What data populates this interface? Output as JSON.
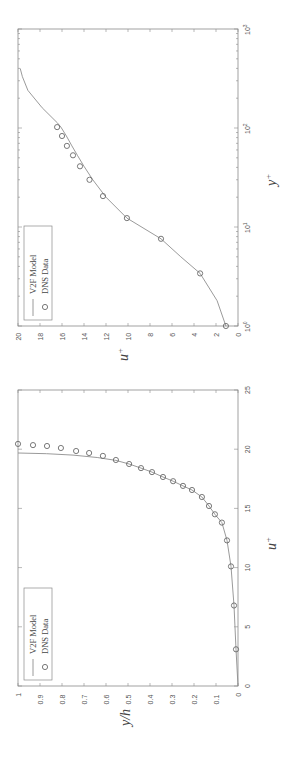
{
  "chart_data": [
    {
      "type": "line",
      "title": "",
      "xlabel": "y+",
      "ylabel": "u+",
      "xscale": "log",
      "xlim": [
        1,
        1000
      ],
      "ylim": [
        0,
        20
      ],
      "xticks": [
        "10^0",
        "10^1",
        "10^2",
        "10^3"
      ],
      "yticks": [
        "0",
        "2",
        "4",
        "6",
        "8",
        "10",
        "12",
        "14",
        "16",
        "18",
        "20"
      ],
      "grid": false,
      "legend_position": "upper left",
      "orientation": "rotated 90° (x-axis vertical on right side, y-axis horizontal at bottom)",
      "series": [
        {
          "name": "V2F Model",
          "style": "line",
          "x": [
            1,
            1.8,
            3.4,
            5.0,
            7.6,
            12.3,
            20,
            30,
            41,
            53,
            66,
            83,
            102,
            112,
            160,
            240,
            330,
            400
          ],
          "y": [
            1.1,
            1.9,
            3.45,
            5.2,
            7.0,
            10.1,
            12.0,
            13.2,
            14.0,
            14.6,
            15.1,
            15.6,
            16.1,
            16.4,
            17.8,
            19.1,
            19.6,
            19.8
          ]
        },
        {
          "name": "DNS Data",
          "style": "circle-markers",
          "x": [
            1.0,
            3.4,
            7.6,
            12.3,
            20.5,
            30,
            41,
            53,
            66,
            83,
            102
          ],
          "y": [
            1.1,
            3.45,
            7.0,
            10.1,
            12.27,
            13.5,
            14.36,
            15.0,
            15.55,
            16.0,
            16.45
          ]
        }
      ]
    },
    {
      "type": "line",
      "title": "",
      "xlabel": "u+",
      "ylabel": "y/h",
      "xlim": [
        0,
        25
      ],
      "ylim": [
        0,
        1
      ],
      "xticks": [
        "0",
        "5",
        "10",
        "15",
        "20",
        "25"
      ],
      "yticks": [
        "0",
        "0.1",
        "0.2",
        "0.3",
        "0.4",
        "0.5",
        "0.6",
        "0.7",
        "0.8",
        "0.9",
        "1"
      ],
      "grid": false,
      "legend_position": "upper left",
      "orientation": "rotated 90° (x-axis vertical on right side, y-axis horizontal at bottom)",
      "series": [
        {
          "name": "V2F Model",
          "style": "line",
          "x": [
            0,
            3.1,
            6.8,
            10.1,
            12.3,
            13.8,
            14.5,
            15.2,
            15.96,
            16.55,
            16.9,
            17.3,
            17.65,
            18.07,
            18.4,
            18.75,
            19.05,
            19.3,
            19.5,
            19.62,
            19.68
          ],
          "y": [
            0,
            0.009,
            0.018,
            0.032,
            0.05,
            0.073,
            0.105,
            0.132,
            0.164,
            0.209,
            0.25,
            0.295,
            0.341,
            0.391,
            0.441,
            0.495,
            0.555,
            0.64,
            0.75,
            0.87,
            1.0
          ]
        },
        {
          "name": "DNS Data",
          "style": "circle-markers",
          "x": [
            3.1,
            6.8,
            10.1,
            12.3,
            13.8,
            14.5,
            15.2,
            15.96,
            16.55,
            16.9,
            17.3,
            17.65,
            18.07,
            18.4,
            18.75,
            19.09,
            19.43,
            19.68,
            19.85,
            20.1,
            20.27,
            20.35,
            20.45
          ],
          "y": [
            0.009,
            0.018,
            0.032,
            0.05,
            0.073,
            0.105,
            0.132,
            0.164,
            0.209,
            0.25,
            0.295,
            0.341,
            0.391,
            0.441,
            0.495,
            0.555,
            0.614,
            0.677,
            0.736,
            0.805,
            0.868,
            0.932,
            1.0
          ]
        }
      ]
    }
  ],
  "plots": {
    "top": {
      "axis_label_x": "y",
      "axis_label_x_sup": "+",
      "axis_label_y": "u",
      "axis_label_y_sup": "+",
      "legend": {
        "line_label": "V2F Model",
        "marker_label": "DNS Data"
      },
      "xtick_labels": [
        {
          "base": "10",
          "exp": "0"
        },
        {
          "base": "10",
          "exp": "1"
        },
        {
          "base": "10",
          "exp": "2"
        },
        {
          "base": "10",
          "exp": "3"
        }
      ],
      "ytick_labels": [
        "0",
        "2",
        "4",
        "6",
        "8",
        "10",
        "12",
        "14",
        "16",
        "18",
        "20"
      ]
    },
    "bottom": {
      "axis_label_x": "u",
      "axis_label_x_sup": "+",
      "axis_label_y": "y/h",
      "legend": {
        "line_label": "V2F Model",
        "marker_label": "DNS Data"
      },
      "xtick_labels": [
        "0",
        "5",
        "10",
        "15",
        "20",
        "25"
      ],
      "ytick_labels": [
        "0",
        "0.1",
        "0.2",
        "0.3",
        "0.4",
        "0.5",
        "0.6",
        "0.7",
        "0.8",
        "0.9",
        "1"
      ]
    }
  },
  "colors": {
    "frame": "#8a8a8a",
    "curve": "#8f8f8f",
    "marker": "#6a6a6a",
    "text": "#555555"
  }
}
